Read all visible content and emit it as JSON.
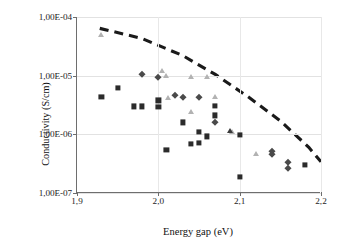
{
  "chart_data": {
    "type": "scatter",
    "title": "",
    "xlabel": "Energy gap (eV)",
    "ylabel": "Conductivity (S/cm)",
    "xlim": [
      1.9,
      2.2
    ],
    "ylim": [
      1e-07,
      0.0001
    ],
    "yscale": "log",
    "grid": true,
    "legend": "none",
    "xticks": [
      "1,9",
      "2,0",
      "2,1",
      "2,2"
    ],
    "xtick_values": [
      1.9,
      2.0,
      2.1,
      2.2
    ],
    "yticks": [
      "1,00E-07",
      "1,00E-06",
      "1,00E-05",
      "1,00E-04"
    ],
    "ytick_values": [
      1e-07,
      1e-06,
      1e-05,
      0.0001
    ],
    "series": [
      {
        "name": "squares",
        "marker": "square",
        "color": "#2b2b2b",
        "points": [
          [
            1.93,
            4.4e-06
          ],
          [
            1.95,
            6.1e-06
          ],
          [
            1.97,
            3e-06
          ],
          [
            1.98,
            3e-06
          ],
          [
            2.0,
            3.8e-06
          ],
          [
            2.0,
            2.9e-06
          ],
          [
            2.01,
            5.5e-07
          ],
          [
            2.03,
            1.6e-06
          ],
          [
            2.04,
            6.8e-07
          ],
          [
            2.05,
            1.1e-06
          ],
          [
            2.05,
            7.2e-07
          ],
          [
            2.06,
            9.2e-07
          ],
          [
            2.07,
            3.1e-06
          ],
          [
            2.07,
            2.1e-06
          ],
          [
            2.1,
            9.9e-07
          ],
          [
            2.1,
            1.9e-07
          ],
          [
            2.18,
            3e-07
          ]
        ]
      },
      {
        "name": "triangles",
        "marker": "triangle",
        "color": "#b2b2b2",
        "points": [
          [
            1.93,
            5e-05
          ],
          [
            2.005,
            1.2e-05
          ],
          [
            2.01,
            9.8e-06
          ],
          [
            2.012,
            4.2e-06
          ],
          [
            2.04,
            9.5e-06
          ],
          [
            2.04,
            2.4e-06
          ],
          [
            2.06,
            9.5e-06
          ],
          [
            2.07,
            4.3e-06
          ],
          [
            2.09,
            1.1e-06
          ],
          [
            2.12,
            4.7e-07
          ]
        ]
      },
      {
        "name": "diamonds",
        "marker": "diamond",
        "color": "#4a4a4a",
        "points": [
          [
            1.98,
            1.05e-05
          ],
          [
            2.0,
            9.4e-06
          ],
          [
            2.02,
            4.6e-06
          ],
          [
            2.03,
            4.3e-06
          ],
          [
            2.05,
            4.4e-06
          ],
          [
            2.07,
            1.6e-06
          ],
          [
            2.14,
            5.2e-07
          ],
          [
            2.14,
            4.7e-07
          ],
          [
            2.16,
            3.4e-07
          ],
          [
            2.16,
            2.7e-07
          ]
        ]
      },
      {
        "name": "dark-triangles",
        "marker": "triangle-dark",
        "color": "#3a3a3a",
        "points": [
          [
            2.088,
            1.15e-06
          ]
        ]
      }
    ],
    "trend_line": {
      "style": "dashed",
      "color": "#1a1a1a",
      "points": [
        [
          1.928,
          6.4e-05
        ],
        [
          1.98,
          4.3e-05
        ],
        [
          2.03,
          2.2e-05
        ],
        [
          2.07,
          1.05e-05
        ],
        [
          2.11,
          4.4e-06
        ],
        [
          2.15,
          1.7e-06
        ],
        [
          2.185,
          6e-07
        ],
        [
          2.2,
          3.4e-07
        ]
      ]
    }
  }
}
